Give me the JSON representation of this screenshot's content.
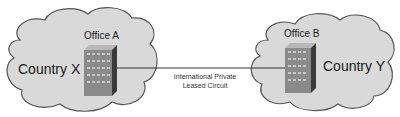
{
  "diagram": {
    "type": "network",
    "nodes": [
      {
        "id": "office-a",
        "label": "Office A",
        "region": "Country X"
      },
      {
        "id": "office-b",
        "label": "Office B",
        "region": "Country Y"
      }
    ],
    "link": {
      "from": "office-a",
      "to": "office-b",
      "label_line1": "International Private",
      "label_line2": "Leased Circuit"
    },
    "colors": {
      "cloud_fill": "#d9d9d9",
      "cloud_stroke": "#555555",
      "building_front": "#8a8a8a",
      "building_side": "#3a3a3a",
      "line": "#333333"
    }
  }
}
